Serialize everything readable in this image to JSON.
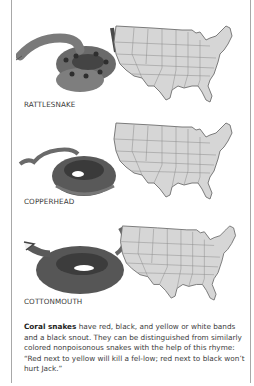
{
  "panels": [
    {
      "snake": "rattlesnake",
      "label": "RATTLESNAKE",
      "map": "us-map-states"
    },
    {
      "snake": "copperhead",
      "label": "COPPERHEAD",
      "map": "us-map-states"
    },
    {
      "snake": "cottonmouth",
      "label": "COTTONMOUTH",
      "map": "us-map-states"
    }
  ],
  "caption": {
    "bold": "Coral snakes",
    "text": " have red, black, and yellow or white bands and a black snout. They can be distinguished from similarly colored nonpoisonous snakes with the help of this rhyme: “Red next to yellow will kill a fel-low; red next to black won’t hurt Jack.”"
  },
  "colors": {
    "map_fill": "#d6d6d6",
    "map_stroke": "#7a7a7a",
    "frame": "#a8a8a8"
  }
}
